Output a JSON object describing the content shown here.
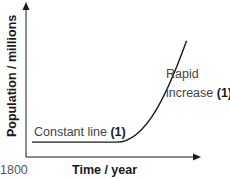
{
  "chart_data": {
    "type": "line",
    "title": "",
    "xlabel": "Time / year",
    "ylabel": "Population / millions",
    "x_ticks": [
      "1800"
    ],
    "grid": false,
    "legend": "none",
    "series": [
      {
        "name": "Population",
        "shape": "constant then rapid exponential increase",
        "x": [
          0,
          0.25,
          0.5,
          0.6,
          0.7,
          0.78,
          0.85,
          0.92
        ],
        "values": [
          0.1,
          0.1,
          0.1,
          0.11,
          0.15,
          0.28,
          0.5,
          0.78
        ]
      }
    ],
    "annotations": [
      {
        "text": "Constant line",
        "mark": "(1)",
        "target": "flat segment"
      },
      {
        "text_lines": [
          "Rapid",
          "increase"
        ],
        "mark": "(1)",
        "target": "rising segment"
      }
    ],
    "colors": {
      "axis": "#1a1a1a",
      "curve": "#1a1a1a",
      "text": "#444444"
    }
  }
}
